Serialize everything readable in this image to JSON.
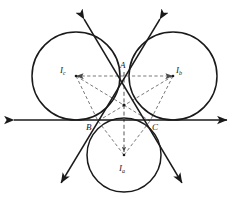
{
  "figure": {
    "background_color": "#ffffff",
    "stroke_color": "#1a1a1a",
    "dash_color": "#4a4a4a",
    "width": 241,
    "height": 210
  },
  "labels": {
    "vertex_a": "A",
    "vertex_b": "B",
    "vertex_c": "C",
    "excenter_a_main": "I",
    "excenter_a_sub": "a",
    "excenter_b_main": "I",
    "excenter_b_sub": "b",
    "excenter_c_main": "I",
    "excenter_c_sub": "c"
  },
  "chart_data": {
    "type": "scatter",
    "xlabel": "",
    "ylabel": "",
    "xlim": [
      0,
      241
    ],
    "ylim": [
      210,
      0
    ],
    "grid": false,
    "legend": "none",
    "points": [
      {
        "name": "A",
        "x": 124,
        "y": 72
      },
      {
        "name": "B",
        "x": 98,
        "y": 121
      },
      {
        "name": "C",
        "x": 150,
        "y": 121
      },
      {
        "name": "I_a",
        "x": 124,
        "y": 155
      },
      {
        "name": "I_b",
        "x": 173,
        "y": 76
      },
      {
        "name": "I_c",
        "x": 76,
        "y": 76
      },
      {
        "name": "incenter",
        "x": 124,
        "y": 105
      }
    ],
    "circles": [
      {
        "name": "excircle_c",
        "cx": 76,
        "cy": 76,
        "r": 44
      },
      {
        "name": "excircle_b",
        "cx": 173,
        "cy": 76,
        "r": 44
      },
      {
        "name": "excircle_a",
        "cx": 124,
        "cy": 155,
        "r": 37
      }
    ],
    "lines": [
      {
        "name": "line-bc",
        "x1": 8,
        "y1": 120,
        "x2": 233,
        "y2": 120,
        "arrows": "both"
      },
      {
        "name": "line-ab",
        "x1": 81,
        "y1": 14,
        "x2": 185,
        "y2": 188,
        "arrows": "both"
      },
      {
        "name": "line-ac",
        "x1": 163,
        "y1": 14,
        "x2": 58,
        "y2": 188,
        "arrows": "both"
      }
    ],
    "dashed_segments": [
      {
        "name": "ic-to-ib",
        "from": "I_c",
        "to": "I_b"
      },
      {
        "name": "ic-to-b",
        "from": "I_c",
        "to": "B"
      },
      {
        "name": "ic-to-c",
        "from": "I_c",
        "to": "C"
      },
      {
        "name": "ib-to-b",
        "from": "I_b",
        "to": "B"
      },
      {
        "name": "ib-to-c",
        "from": "I_b",
        "to": "C"
      },
      {
        "name": "ia-to-b",
        "from": "I_a",
        "to": "B"
      },
      {
        "name": "ia-to-c",
        "from": "I_a",
        "to": "C"
      },
      {
        "name": "a-to-ia",
        "from": "A",
        "to": "I_a"
      }
    ]
  },
  "label_positions": {
    "vertex_a": {
      "left": 120,
      "top": 62
    },
    "vertex_b": {
      "left": 86,
      "top": 123
    },
    "vertex_c": {
      "left": 152,
      "top": 123
    },
    "excenter_a": {
      "left": 119,
      "top": 164
    },
    "excenter_b": {
      "left": 174,
      "top": 67
    },
    "excenter_c": {
      "left": 62,
      "top": 67
    }
  }
}
